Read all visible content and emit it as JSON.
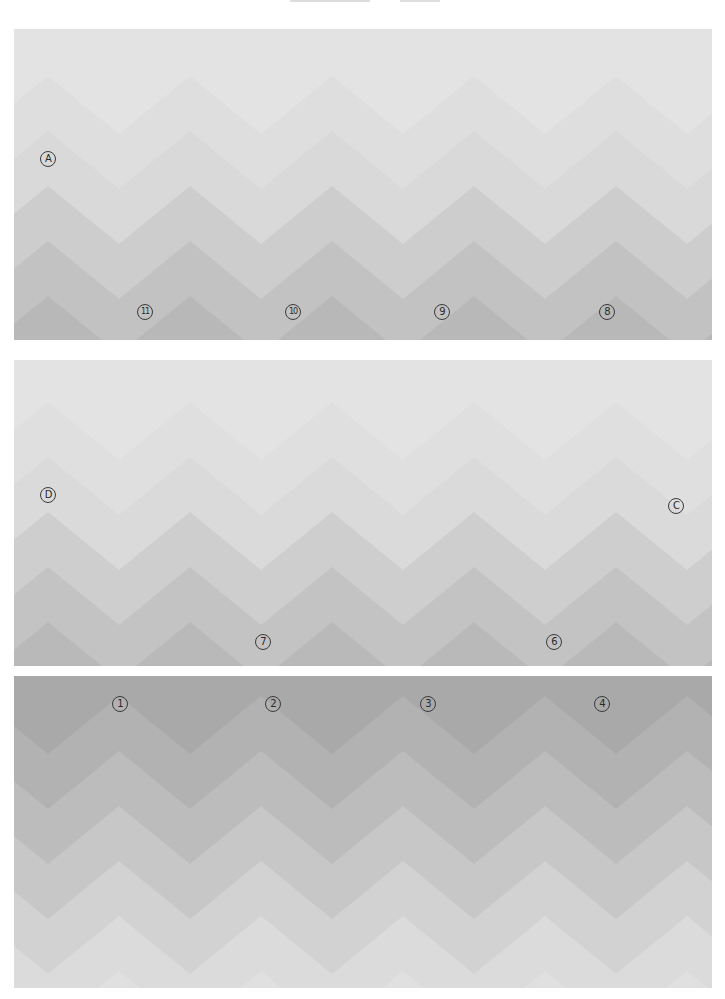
{
  "page": {
    "width": 725,
    "height": 999,
    "background": "#ffffff"
  },
  "pattern": {
    "period": 142,
    "amplitude": 58,
    "band_step": 55
  },
  "panels": [
    {
      "id": "panel-1",
      "x": 14,
      "y": 29,
      "w": 698,
      "h": 311,
      "orientation": "up",
      "phase_x": 34,
      "first_peak_y": -8,
      "band_colors": [
        "#e3e3e3",
        "#dedede",
        "#d9d9d9",
        "#cdcdcd",
        "#c2c2c2",
        "#b8b8b8",
        "#adadad"
      ],
      "labels": [
        {
          "text": "A",
          "x": 34,
          "y": 130
        },
        {
          "text": "11",
          "x": 131,
          "y": 283
        },
        {
          "text": "10",
          "x": 279,
          "y": 283
        },
        {
          "text": "9",
          "x": 428,
          "y": 283
        },
        {
          "text": "8",
          "x": 593,
          "y": 283
        }
      ]
    },
    {
      "id": "panel-2",
      "x": 14,
      "y": 360,
      "w": 698,
      "h": 306,
      "orientation": "up",
      "phase_x": 34,
      "first_peak_y": -13,
      "band_colors": [
        "#e3e3e3",
        "#dfdfdf",
        "#dadada",
        "#cecece",
        "#c3c3c3",
        "#b9b9b9",
        "#aeaeae"
      ],
      "labels": [
        {
          "text": "D",
          "x": 34,
          "y": 135
        },
        {
          "text": "C",
          "x": 662,
          "y": 146
        },
        {
          "text": "7",
          "x": 249,
          "y": 282
        },
        {
          "text": "6",
          "x": 540,
          "y": 282
        }
      ]
    },
    {
      "id": "panel-3",
      "x": 14,
      "y": 676,
      "w": 698,
      "h": 312,
      "orientation": "down",
      "phase_x": 105,
      "first_peak_y": -35,
      "band_colors": [
        "#a9a9a9",
        "#b2b2b2",
        "#bcbcbc",
        "#c7c7c7",
        "#d2d2d2",
        "#dbdbdb",
        "#e0e0e0",
        "#e3e3e3"
      ],
      "labels": [
        {
          "text": "1",
          "x": 106,
          "y": 28
        },
        {
          "text": "2",
          "x": 259,
          "y": 28
        },
        {
          "text": "3",
          "x": 414,
          "y": 28
        },
        {
          "text": "4",
          "x": 588,
          "y": 28
        }
      ]
    }
  ]
}
